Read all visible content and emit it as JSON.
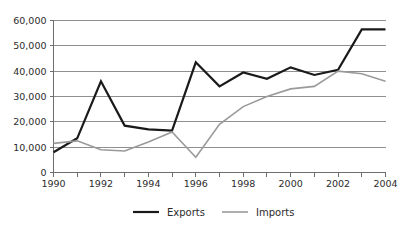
{
  "chart_data": {
    "type": "line",
    "title": "",
    "subtitle": "",
    "xlabel": "",
    "ylabel": "",
    "x": [
      1990,
      1991,
      1992,
      1993,
      1994,
      1995,
      1996,
      1997,
      1998,
      1999,
      2000,
      2001,
      2002,
      2003,
      2004
    ],
    "xlim": [
      1990,
      2004
    ],
    "ylim": [
      0,
      60000
    ],
    "y_ticks": [
      0,
      10000,
      20000,
      30000,
      40000,
      50000,
      60000
    ],
    "y_tick_labels": [
      "0",
      "10,000",
      "20,000",
      "30,000",
      "40,000",
      "50,000",
      "60,000"
    ],
    "x_ticks": [
      1990,
      1991,
      1992,
      1993,
      1994,
      1995,
      1996,
      1997,
      1998,
      1999,
      2000,
      2001,
      2002,
      2003,
      2004
    ],
    "x_tick_labels_shown": [
      "1990",
      "1992",
      "1994",
      "1996",
      "1998",
      "2000",
      "2002",
      "2004"
    ],
    "grid": true,
    "grid_axis": "y",
    "legend_position": "bottom",
    "series": [
      {
        "name": "Exports",
        "color": "#1a1a1a",
        "width": 2.2,
        "values": [
          8000,
          13500,
          36000,
          18500,
          17000,
          16500,
          43500,
          34000,
          39500,
          37000,
          41500,
          38500,
          40500,
          56500,
          56500
        ]
      },
      {
        "name": "Imports",
        "color": "#9a9a9a",
        "width": 1.6,
        "values": [
          11500,
          12500,
          9000,
          8500,
          12000,
          16000,
          6000,
          19000,
          26000,
          30000,
          33000,
          34000,
          40000,
          39000,
          36000
        ]
      }
    ]
  },
  "legend": {
    "items": [
      {
        "label": "Exports",
        "color": "#1a1a1a"
      },
      {
        "label": "Imports",
        "color": "#9a9a9a"
      }
    ]
  },
  "colors": {
    "exports": "#1a1a1a",
    "imports": "#9a9a9a",
    "gridline": "#8f8f8f",
    "axis": "#6e6e6e",
    "text": "#2b2b2b",
    "background": "#ffffff"
  }
}
